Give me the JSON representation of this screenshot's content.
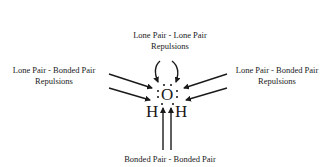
{
  "diagram": {
    "labels": {
      "top": {
        "line1": "Lone Pair - Lone Pair",
        "line2": "Repulsions"
      },
      "left": {
        "line1": "Lone Pair - Bonded Pair",
        "line2": "Repulsions"
      },
      "right": {
        "line1": "Lone Pair - Bonded Pair",
        "line2": "Repulsions"
      },
      "bottom": {
        "line1": "Bonded Pair - Bonded Pair"
      }
    },
    "molecule": {
      "central_atom": "O",
      "left_atom": "H",
      "right_atom": "H"
    },
    "colors": {
      "ink": "#1a1a1a",
      "background": "#ffffff"
    }
  }
}
